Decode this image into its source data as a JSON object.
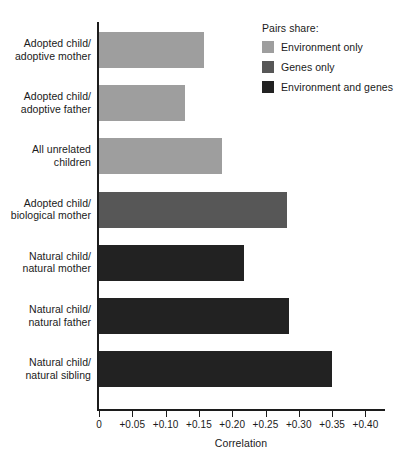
{
  "chart_data": {
    "type": "bar",
    "orientation": "horizontal",
    "title": "",
    "xlabel": "Correlation",
    "ylabel": "",
    "xlim": [
      0,
      0.4
    ],
    "grid": false,
    "categories": [
      "Adopted child/ adoptive mother",
      "Adopted child/ adoptive father",
      "All unrelated children",
      "Adopted child/ biological mother",
      "Natural child/ natural mother",
      "Natural child/ natural father",
      "Natural child/ natural sibling"
    ],
    "values": [
      0.158,
      0.129,
      0.185,
      0.282,
      0.218,
      0.285,
      0.35
    ],
    "tick_labels": [
      "0",
      "+0.05",
      "+0.10",
      "+0.15",
      "+0.20",
      "+0.25",
      "+0.30",
      "+0.35",
      "+0.40"
    ],
    "tick_values": [
      0,
      0.05,
      0.1,
      0.15,
      0.2,
      0.25,
      0.3,
      0.35,
      0.4
    ],
    "legend": {
      "position": "top-right",
      "title": "Pairs share:",
      "entries": [
        {
          "label": "Environment only",
          "color": "#9e9e9e"
        },
        {
          "label": "Genes only",
          "color": "#575757"
        },
        {
          "label": "Environment and genes",
          "color": "#222222"
        }
      ]
    },
    "bars": [
      {
        "line1": "Adopted child/",
        "line2": "adoptive mother",
        "value": 0.158,
        "group": "Environment only",
        "color": "#9e9e9e"
      },
      {
        "line1": "Adopted child/",
        "line2": "adoptive father",
        "value": 0.129,
        "group": "Environment only",
        "color": "#9e9e9e"
      },
      {
        "line1": "All unrelated",
        "line2": "children",
        "value": 0.185,
        "group": "Environment only",
        "color": "#9e9e9e"
      },
      {
        "line1": "Adopted child/",
        "line2": "biological mother",
        "value": 0.282,
        "group": "Genes only",
        "color": "#575757"
      },
      {
        "line1": "Natural child/",
        "line2": "natural mother",
        "value": 0.218,
        "group": "Environment and genes",
        "color": "#222222"
      },
      {
        "line1": "Natural child/",
        "line2": "natural father",
        "value": 0.285,
        "group": "Environment and genes",
        "color": "#222222"
      },
      {
        "line1": "Natural child/",
        "line2": "natural sibling",
        "value": 0.35,
        "group": "Environment and genes",
        "color": "#222222"
      }
    ]
  },
  "axis": {
    "x_title": "Correlation"
  },
  "colors": {
    "axis": "#1c1c1c",
    "text": "#1a1a1a",
    "background": "#ffffff",
    "environment_only": "#9e9e9e",
    "genes_only": "#575757",
    "environment_and_genes": "#222222"
  }
}
